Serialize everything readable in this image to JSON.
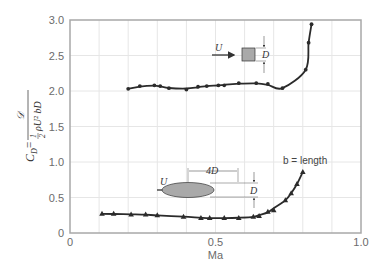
{
  "chart_data": {
    "type": "line",
    "title": "",
    "xlabel": "Ma",
    "ylabel": "C_D = 𝒟 / (½ ρ U² b D)",
    "xlim": [
      0,
      1.0
    ],
    "ylim": [
      0,
      3.0
    ],
    "x_ticks": [
      "0",
      "0.5",
      "1.0"
    ],
    "y_ticks": [
      "0",
      "0.5",
      "1.0",
      "1.5",
      "2.0",
      "2.5",
      "3.0"
    ],
    "grid": true,
    "series": [
      {
        "name": "Square cylinder (side D)",
        "marker": "circle",
        "x": [
          0.2,
          0.24,
          0.29,
          0.31,
          0.34,
          0.4,
          0.44,
          0.47,
          0.51,
          0.53,
          0.58,
          0.64,
          0.68,
          0.73,
          0.81,
          0.82,
          0.83
        ],
        "y": [
          2.03,
          2.07,
          2.08,
          2.07,
          2.04,
          2.02,
          2.06,
          2.07,
          2.08,
          2.08,
          2.11,
          2.11,
          2.1,
          2.04,
          2.3,
          2.68,
          2.94
        ]
      },
      {
        "name": "Elliptical cylinder (4D × D)",
        "marker": "triangle",
        "x": [
          0.11,
          0.15,
          0.21,
          0.26,
          0.3,
          0.39,
          0.45,
          0.48,
          0.53,
          0.58,
          0.63,
          0.65,
          0.68,
          0.7,
          0.74,
          0.76,
          0.78,
          0.8
        ],
        "y": [
          0.27,
          0.27,
          0.26,
          0.26,
          0.25,
          0.23,
          0.21,
          0.21,
          0.21,
          0.21,
          0.23,
          0.24,
          0.3,
          0.32,
          0.46,
          0.56,
          0.69,
          0.86
        ]
      }
    ],
    "annotations": [
      {
        "text": "U",
        "near": "square"
      },
      {
        "text": "D",
        "near": "square"
      },
      {
        "text": "U",
        "near": "ellipse"
      },
      {
        "text": "4D",
        "near": "ellipse"
      },
      {
        "text": "D",
        "near": "ellipse"
      },
      {
        "text": "b = length"
      }
    ]
  },
  "labels": {
    "xlabel": "Ma",
    "y_cd": "C",
    "y_cd_sub": "D",
    "y_eq": " = ",
    "y_num": "𝒟",
    "y_one": "1",
    "y_two": "2",
    "y_den": "ρU² bD",
    "x0": "0",
    "x05": "0.5",
    "x10": "1.0",
    "y0": "0",
    "y05": "0.5",
    "y10": "1.0",
    "y15": "1.5",
    "y20": "2.0",
    "y25": "2.5",
    "y30": "3.0",
    "sq_U": "U",
    "sq_D": "D",
    "el_U": "U",
    "el_4D": "4D",
    "el_D": "D",
    "b_len": "b = length"
  },
  "colors": {
    "axis": "#a8a8a8",
    "grid": "#e6e6e6",
    "curve": "#2b2b2b",
    "shape_fill": "#a9a9a9"
  }
}
